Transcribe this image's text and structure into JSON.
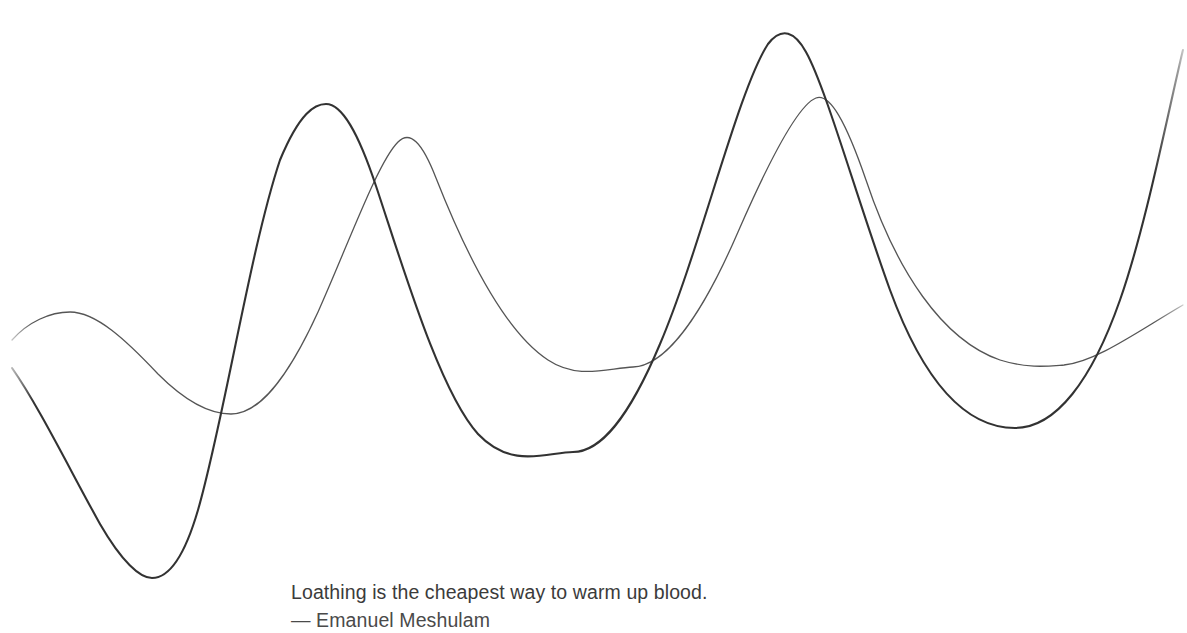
{
  "canvas": {
    "width": 1187,
    "height": 633,
    "background_color": "#ffffff"
  },
  "quote": {
    "text": "Loathing is the cheapest way to warm up blood.",
    "attribution": "— Emanuel Meshulam",
    "text_color": "#3b3b3b",
    "attribution_color": "#4a4a4a"
  },
  "artwork": {
    "name": "two-wave-line-drawing",
    "description": "Two smooth sinusoidal curves crossing each other across the canvas, each fading softly in at the left edge and out at the right edge.",
    "curves": [
      {
        "id": "curve-primary",
        "label": "dark-wave",
        "stroke_color": "#333333",
        "stroke_width": 2.1,
        "fade_ends": true,
        "path": "M 12 368 C 38 405, 70 470, 100 524 C 122 562, 140 578, 152 578 C 168 578, 184 558, 198 510 C 224 420, 250 250, 280 160 C 300 112, 315 104, 326 104 C 342 104, 358 132, 376 186 C 404 270, 440 392, 478 434 C 512 470, 548 452, 573 452 C 600 452, 628 420, 660 344 C 700 250, 738 90, 768 44 C 782 26, 795 32, 806 52 C 826 88, 856 196, 890 290 C 926 388, 968 428, 1015 428 C 1056 428, 1092 380, 1120 300 C 1146 226, 1168 112, 1183 50"
      },
      {
        "id": "curve-secondary",
        "label": "light-wave",
        "stroke_color": "#555555",
        "stroke_width": 1.3,
        "fade_ends": true,
        "path": "M 12 340 C 28 322, 50 312, 70 312 C 96 312, 126 340, 158 374 C 186 402, 210 414, 231 414 C 258 414, 286 382, 318 312 C 350 240, 378 162, 398 142 C 410 130, 422 142, 436 178 C 462 244, 502 330, 548 360 C 578 380, 608 368, 633 367 C 664 366, 700 320, 738 232 C 772 154, 800 104, 816 98 C 830 93, 846 122, 866 180 C 896 270, 942 340, 1000 360 C 1028 369, 1050 366, 1064 365 C 1096 362, 1140 330, 1183 305"
      }
    ]
  }
}
